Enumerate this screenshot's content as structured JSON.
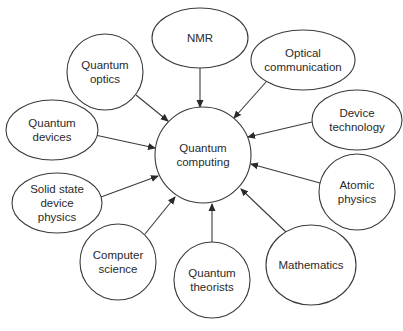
{
  "diagram": {
    "center": {
      "id": "center",
      "label_lines": [
        "Quantum",
        "computing"
      ],
      "shape": "circle",
      "cx": 203,
      "cy": 155,
      "r": 48
    },
    "nodes": [
      {
        "id": "nmr",
        "label_lines": [
          "NMR"
        ],
        "shape": "ellipse",
        "cx": 200,
        "cy": 38,
        "rx": 48,
        "ry": 30
      },
      {
        "id": "optical-communication",
        "label_lines": [
          "Optical",
          "communication"
        ],
        "shape": "ellipse",
        "cx": 303,
        "cy": 60,
        "rx": 52,
        "ry": 30
      },
      {
        "id": "device-technology",
        "label_lines": [
          "Device",
          "technology"
        ],
        "shape": "ellipse",
        "cx": 357,
        "cy": 120,
        "rx": 45,
        "ry": 30
      },
      {
        "id": "atomic-physics",
        "label_lines": [
          "Atomic",
          "physics"
        ],
        "shape": "ellipse",
        "cx": 357,
        "cy": 192,
        "rx": 38,
        "ry": 38
      },
      {
        "id": "mathematics",
        "label_lines": [
          "Mathematics"
        ],
        "shape": "ellipse",
        "cx": 311,
        "cy": 265,
        "rx": 45,
        "ry": 40
      },
      {
        "id": "quantum-theorists",
        "label_lines": [
          "Quantum",
          "theorists"
        ],
        "shape": "ellipse",
        "cx": 212,
        "cy": 280,
        "rx": 38,
        "ry": 38
      },
      {
        "id": "computer-science",
        "label_lines": [
          "Computer",
          "science"
        ],
        "shape": "ellipse",
        "cx": 118,
        "cy": 262,
        "rx": 38,
        "ry": 38
      },
      {
        "id": "solid-state-device-physics",
        "label_lines": [
          "Solid state",
          "device",
          "physics"
        ],
        "shape": "ellipse",
        "cx": 57,
        "cy": 203,
        "rx": 45,
        "ry": 30
      },
      {
        "id": "quantum-devices",
        "label_lines": [
          "Quantum",
          "devices"
        ],
        "shape": "ellipse",
        "cx": 52,
        "cy": 130,
        "rx": 46,
        "ry": 30
      },
      {
        "id": "quantum-optics",
        "label_lines": [
          "Quantum",
          "optics"
        ],
        "shape": "ellipse",
        "cx": 105,
        "cy": 72,
        "rx": 38,
        "ry": 38
      }
    ],
    "edges": [
      {
        "from": "nmr",
        "to": "center",
        "x1": 200,
        "y1": 68,
        "x2": 200,
        "y2": 107
      },
      {
        "from": "optical-communication",
        "to": "center",
        "x1": 266,
        "y1": 82,
        "x2": 234,
        "y2": 118
      },
      {
        "from": "device-technology",
        "to": "center",
        "x1": 312,
        "y1": 122,
        "x2": 248,
        "y2": 137
      },
      {
        "from": "atomic-physics",
        "to": "center",
        "x1": 320,
        "y1": 183,
        "x2": 251,
        "y2": 164
      },
      {
        "from": "mathematics",
        "to": "center",
        "x1": 286,
        "y1": 232,
        "x2": 241,
        "y2": 189
      },
      {
        "from": "quantum-theorists",
        "to": "center",
        "x1": 212,
        "y1": 242,
        "x2": 212,
        "y2": 204
      },
      {
        "from": "computer-science",
        "to": "center",
        "x1": 145,
        "y1": 234,
        "x2": 175,
        "y2": 197
      },
      {
        "from": "solid-state-device-physics",
        "to": "center",
        "x1": 101,
        "y1": 197,
        "x2": 158,
        "y2": 176
      },
      {
        "from": "quantum-devices",
        "to": "center",
        "x1": 95,
        "y1": 135,
        "x2": 155,
        "y2": 148
      },
      {
        "from": "quantum-optics",
        "to": "center",
        "x1": 136,
        "y1": 95,
        "x2": 168,
        "y2": 121
      }
    ],
    "colors": {
      "stroke": "#3a3a3a",
      "text": "#2a2a2a",
      "background": "#ffffff"
    }
  }
}
